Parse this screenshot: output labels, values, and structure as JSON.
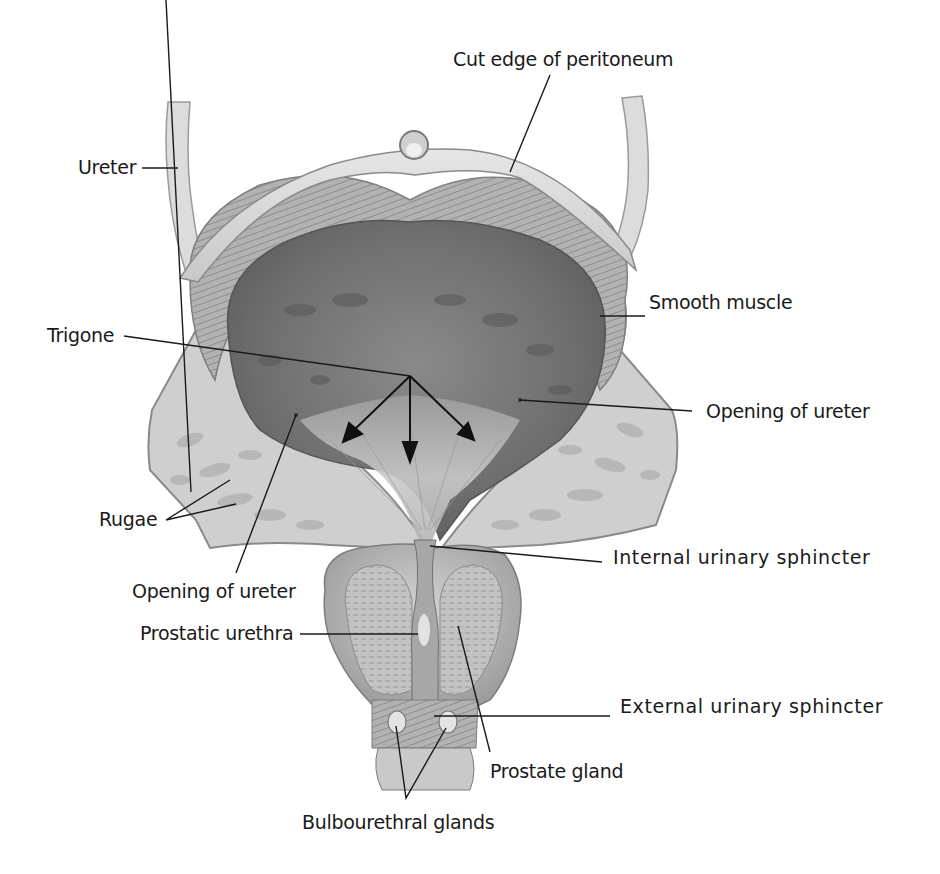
{
  "figure": {
    "colors": {
      "background": "#ffffff",
      "label_text": "#1a1a1a",
      "leader_line": "#1a1a1a",
      "peritoneum": "#d9d9d9",
      "muscle_wall": "#a9a9a9",
      "lumen_dark": "#6f6f6f",
      "trigone_light": "#c4c4c4",
      "rugae_fold": "#cfcfcf",
      "prostate": "#bdbdbd"
    }
  },
  "labels": {
    "cut_edge_of_peritoneum": "Cut edge of peritoneum",
    "ureter": "Ureter",
    "smooth_muscle": "Smooth muscle",
    "trigone": "Trigone",
    "opening_of_ureter_right": "Opening of ureter",
    "rugae": "Rugae",
    "internal_urinary_sphincter": "Internal urinary sphincter",
    "opening_of_ureter_left": "Opening of ureter",
    "prostatic_urethra": "Prostatic urethra",
    "external_urinary_sphincter": "External urinary sphincter",
    "prostate_gland": "Prostate gland",
    "bulbourethral_glands": "Bulbourethral glands"
  }
}
